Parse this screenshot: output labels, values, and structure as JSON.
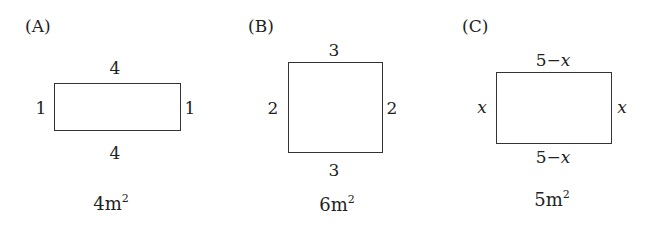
{
  "figures": [
    {
      "label": "(A)",
      "shape": "rectangle",
      "top": "4",
      "bottom": "4",
      "left": "1",
      "right": "1",
      "area_value": "4m",
      "area_exp": "2"
    },
    {
      "label": "(B)",
      "shape": "rectangle",
      "top": "3",
      "bottom": "3",
      "left": "2",
      "right": "2",
      "area_value": "6m",
      "area_exp": "2"
    },
    {
      "label": "(C)",
      "shape": "rectangle",
      "top_num": "5",
      "top_op": "−",
      "top_var": "x",
      "bottom_num": "5",
      "bottom_op": "−",
      "bottom_var": "x",
      "left": "x",
      "right": "x",
      "area_value": "5m",
      "area_exp": "2"
    }
  ]
}
